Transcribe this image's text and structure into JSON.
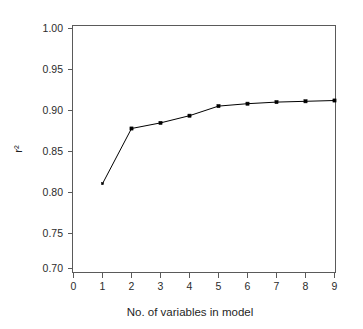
{
  "chart_data": {
    "type": "line",
    "title": "",
    "xlabel": "No. of variables in model",
    "ylabel": "r²",
    "x": [
      1,
      2,
      3,
      4,
      5,
      6,
      7,
      8,
      9
    ],
    "values": [
      0.806,
      0.875,
      0.882,
      0.891,
      0.903,
      0.906,
      0.908,
      0.909,
      0.91
    ],
    "series": [
      {
        "name": "r²",
        "values": [
          0.806,
          0.875,
          0.882,
          0.891,
          0.903,
          0.906,
          0.908,
          0.909,
          0.91
        ]
      }
    ],
    "xlim": [
      0,
      9
    ],
    "ylim": [
      0.7,
      1.0
    ],
    "xticks": [
      0,
      1,
      2,
      3,
      4,
      5,
      6,
      7,
      8,
      9
    ],
    "xtick_labels": [
      "0",
      "1",
      "2",
      "3",
      "4",
      "5",
      "6",
      "7",
      "8",
      "9"
    ],
    "yticks": [
      0.7,
      0.75,
      0.8,
      0.85,
      0.9,
      0.95,
      1.0
    ],
    "ytick_labels": [
      "0.70",
      "0.75",
      "0.80",
      "0.85",
      "0.90",
      "0.95",
      "1.00"
    ],
    "grid": false,
    "legend": null,
    "legend_position": "none",
    "marker": "filled-square",
    "line_color": "#000000",
    "marker_color": "#000000",
    "axis_color": "#5a5a5a",
    "background_color": "#ffffff"
  },
  "axes": {
    "x_title": "No. of variables in model",
    "y_title": "r²"
  },
  "ytick_labels": {
    "t0": "1.00",
    "t1": "0.95",
    "t2": "0.90",
    "t3": "0.85",
    "t4": "0.80",
    "t5": "0.75",
    "t6": "0.70"
  },
  "xtick_labels": {
    "t0": "0",
    "t1": "1",
    "t2": "2",
    "t3": "3",
    "t4": "4",
    "t5": "5",
    "t6": "6",
    "t7": "7",
    "t8": "8",
    "t9": "9"
  }
}
